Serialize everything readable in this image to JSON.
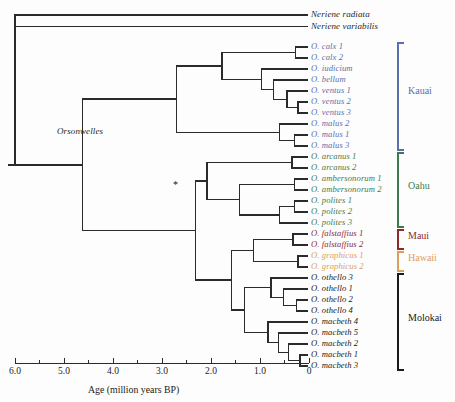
{
  "figure": {
    "type": "phylogenetic-tree",
    "orientation": "left-to-right-reversed-time",
    "genus_label": "Orsonwelles",
    "support_marker": "*"
  },
  "axis": {
    "title": "Age (million years BP)",
    "ticks": [
      "6.0",
      "5.0",
      "4.0",
      "3.0",
      "2.0",
      "1.0",
      "0"
    ],
    "tick_values": [
      6.0,
      5.0,
      4.0,
      3.0,
      2.0,
      1.0,
      0
    ],
    "minor_tick_step": 0.5,
    "range": [
      6.0,
      0
    ],
    "px_per_myr": 49.0,
    "x0_px": 309,
    "x6_px": 15
  },
  "colors": {
    "kauai": "#5b6fae",
    "oahu": "#3f7a4e",
    "maui": "#8c2b2b",
    "hawaii": "#d9a05b",
    "molokai": "#1a1a1a",
    "outgroup": "#262626",
    "branch": "#2b2b2b"
  },
  "outgroup": [
    {
      "name": "Neriene radiata",
      "group": "outgroup"
    },
    {
      "name": "Neriene variabilis",
      "group": "outgroup"
    }
  ],
  "islands": [
    {
      "label": "Kauai",
      "group": "kauai",
      "count": 10
    },
    {
      "label": "Oahu",
      "group": "oahu",
      "count": 7
    },
    {
      "label": "Maui",
      "group": "maui",
      "count": 2
    },
    {
      "label": "Hawaii",
      "group": "hawaii",
      "count": 2
    },
    {
      "label": "Molokai",
      "group": "molokai",
      "count": 9
    }
  ],
  "tips": [
    {
      "name": "Neriene radiata",
      "group": "outgroup",
      "y": 15.0
    },
    {
      "name": "Neriene variabilis",
      "group": "outgroup",
      "y": 26.5
    },
    {
      "name": "O. calx 1",
      "group": "kauai",
      "y": 47.0
    },
    {
      "name": "O. calx 2",
      "group": "kauai",
      "y": 58.0
    },
    {
      "name": "O. iudicium",
      "group": "kauai",
      "y": 69.0
    },
    {
      "name": "O. bellum",
      "group": "kauai",
      "y": 80.0
    },
    {
      "name": "O. ventus 1",
      "group": "kauai",
      "y": 91.0
    },
    {
      "name": "O. ventus 2",
      "group": "kauai",
      "y": 102.0
    },
    {
      "name": "O. ventus 3",
      "group": "kauai",
      "y": 113.0
    },
    {
      "name": "O. malus 2",
      "group": "kauai",
      "y": 124.0
    },
    {
      "name": "O. malus 1",
      "group": "kauai",
      "y": 135.0
    },
    {
      "name": "O. malus 3",
      "group": "kauai",
      "y": 146.0
    },
    {
      "name": "O. arcanus 1",
      "group": "oahu",
      "y": 157.0
    },
    {
      "name": "O. arcanus 2",
      "group": "oahu",
      "y": 168.0
    },
    {
      "name": "O. ambersonorum 1",
      "group": "oahu",
      "y": 179.0
    },
    {
      "name": "O. ambersonorum 2",
      "group": "oahu",
      "y": 190.0
    },
    {
      "name": "O. polites 1",
      "group": "oahu",
      "y": 201.0
    },
    {
      "name": "O. polites 2",
      "group": "oahu",
      "y": 212.0
    },
    {
      "name": "O. polites 3",
      "group": "oahu",
      "y": 223.0
    },
    {
      "name": "O. falstaffius 1",
      "group": "maui",
      "y": 234.0
    },
    {
      "name": "O. falstaffius 2",
      "group": "maui",
      "y": 245.0
    },
    {
      "name": "O. graphicus 1",
      "group": "hawaii",
      "y": 256.0
    },
    {
      "name": "O. graphicus 2",
      "group": "hawaii",
      "y": 267.0
    },
    {
      "name": "O. othello 3",
      "group": "molokai",
      "y": 278.0
    },
    {
      "name": "O. othello 1",
      "group": "molokai",
      "y": 289.0
    },
    {
      "name": "O. othello 2",
      "group": "molokai",
      "y": 300.0
    },
    {
      "name": "O. othello 4",
      "group": "molokai",
      "y": 311.0
    },
    {
      "name": "O. macbeth 4",
      "group": "molokai",
      "y": 322.0
    },
    {
      "name": "O. macbeth 5",
      "group": "molokai",
      "y": 333.0
    },
    {
      "name": "O. macbeth 2",
      "group": "molokai",
      "y": 344.0
    },
    {
      "name": "O. macbeth 1",
      "group": "molokai",
      "y": 355.0
    },
    {
      "name": "O. macbeth 3",
      "group": "molokai",
      "y": 366.0
    }
  ],
  "island_brackets": [
    {
      "label": "Kauai",
      "group": "kauai",
      "top": 43.0,
      "bottom": 150.0,
      "text_y": 91.0
    },
    {
      "label": "Oahu",
      "group": "oahu",
      "top": 153.0,
      "bottom": 227.0,
      "text_y": 186.0
    },
    {
      "label": "Maui",
      "group": "maui",
      "top": 230.0,
      "bottom": 249.0,
      "text_y": 236.0
    },
    {
      "label": "Hawaii",
      "group": "hawaii",
      "top": 252.0,
      "bottom": 271.0,
      "text_y": 258.0
    },
    {
      "label": "Molokai",
      "group": "molokai",
      "top": 274.0,
      "bottom": 370.0,
      "text_y": 318.0
    }
  ]
}
